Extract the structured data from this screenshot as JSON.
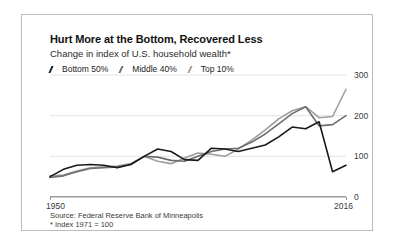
{
  "chart_data": {
    "type": "line",
    "title": "Hurt More at the Bottom, Recovered Less",
    "subtitle": "Change in index of U.S. household wealth*",
    "xlabel": "",
    "ylabel": "",
    "xlim": [
      1950,
      2016
    ],
    "ylim": [
      0,
      300
    ],
    "yticks": [
      0,
      100,
      200,
      300
    ],
    "xticks": [
      1950,
      2016
    ],
    "xtick_labels": [
      "1950",
      "2016"
    ],
    "grid": true,
    "grid_axis": "y",
    "legend_position": "top-left",
    "source": "Source: Federal Reserve Bank of Minneapolis",
    "footnote": "* Index 1971 = 100",
    "x": [
      1950,
      1953,
      1956,
      1959,
      1962,
      1965,
      1968,
      1971,
      1974,
      1977,
      1980,
      1983,
      1986,
      1989,
      1992,
      1995,
      1998,
      2001,
      2004,
      2007,
      2010,
      2013,
      2016
    ],
    "series": [
      {
        "name": "Bottom 50%",
        "color": "#1a1a1a",
        "values": [
          50,
          68,
          78,
          80,
          78,
          72,
          80,
          100,
          118,
          112,
          92,
          90,
          120,
          118,
          112,
          120,
          128,
          148,
          172,
          168,
          185,
          62,
          78
        ]
      },
      {
        "name": "Middle 40%",
        "color": "#6e6e6e",
        "values": [
          48,
          52,
          62,
          70,
          72,
          74,
          80,
          100,
          98,
          90,
          88,
          100,
          112,
          118,
          120,
          135,
          155,
          180,
          205,
          222,
          175,
          178,
          200
        ]
      },
      {
        "name": "Top 10%",
        "color": "#9d9d9d",
        "values": [
          52,
          54,
          64,
          72,
          74,
          76,
          82,
          100,
          88,
          82,
          96,
          108,
          105,
          100,
          118,
          140,
          165,
          192,
          212,
          222,
          195,
          198,
          265
        ]
      }
    ]
  }
}
